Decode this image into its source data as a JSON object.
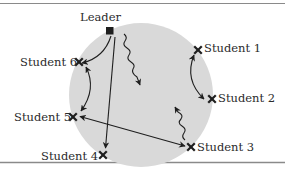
{
  "diagram": {
    "type": "communication-network",
    "colors": {
      "circle_fill": "#d9d9d9",
      "ink": "#1e1e1e",
      "rule": "#8a8a8a",
      "background": "#ffffff"
    },
    "leader": {
      "label": "Leader",
      "marker": "square"
    },
    "students": [
      {
        "id": 1,
        "label": "Student 1",
        "marker": "x"
      },
      {
        "id": 2,
        "label": "Student 2",
        "marker": "x"
      },
      {
        "id": 3,
        "label": "Student 3",
        "marker": "x"
      },
      {
        "id": 4,
        "label": "Student 4",
        "marker": "x"
      },
      {
        "id": 5,
        "label": "Student 5",
        "marker": "x"
      },
      {
        "id": 6,
        "label": "Student 6",
        "marker": "x"
      }
    ],
    "connections": [
      {
        "from": "Leader",
        "to": "Student 6",
        "style": "curved-arrow",
        "direction": "one-way"
      },
      {
        "from": "Leader",
        "to": "Student 4",
        "style": "straight-arrow",
        "direction": "one-way"
      },
      {
        "from": "Leader",
        "to": "group",
        "style": "wavy-arrow",
        "direction": "one-way"
      },
      {
        "from": "Student 6",
        "to": "Student 5",
        "style": "curved-arrow",
        "direction": "two-way"
      },
      {
        "from": "Student 1",
        "to": "Student 2",
        "style": "curved-arrow",
        "direction": "two-way"
      },
      {
        "from": "Student 5",
        "to": "Student 3",
        "style": "straight-arrow",
        "direction": "two-way"
      },
      {
        "from": "Student 3",
        "to": "group",
        "style": "wavy-arrow",
        "direction": "one-way"
      }
    ]
  }
}
